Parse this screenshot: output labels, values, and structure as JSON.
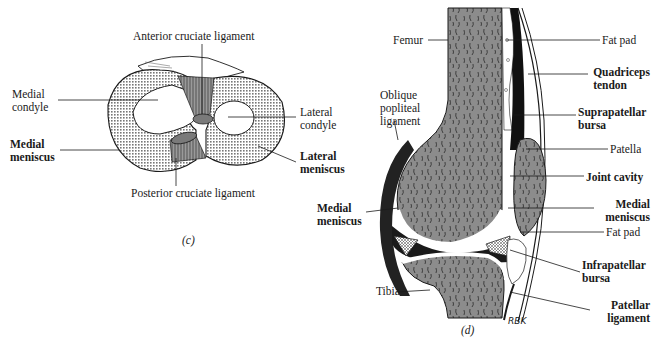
{
  "figure_c": {
    "caption": "(c)",
    "labels": {
      "anterior_cruciate": "Anterior cruciate ligament",
      "medial_condyle_1": "Medial",
      "medial_condyle_2": "condyle",
      "medial_meniscus_1": "Medial",
      "medial_meniscus_2": "meniscus",
      "lateral_condyle_1": "Lateral",
      "lateral_condyle_2": "condyle",
      "lateral_meniscus_1": "Lateral",
      "lateral_meniscus_2": "meniscus",
      "posterior_cruciate": "Posterior cruciate ligament"
    }
  },
  "figure_d": {
    "caption": "(d)",
    "signature": "RBK",
    "labels": {
      "femur": "Femur",
      "oblique_1": "Oblique",
      "oblique_2": "popliteal",
      "oblique_3": "ligament",
      "medial_meniscus_left_1": "Medial",
      "medial_meniscus_left_2": "meniscus",
      "tibia": "Tibia",
      "fat_pad_top": "Fat pad",
      "quadriceps_1": "Quadriceps",
      "quadriceps_2": "tendon",
      "suprapatellar_1": "Suprapatellar",
      "suprapatellar_2": "bursa",
      "patella": "Patella",
      "joint_cavity": "Joint cavity",
      "medial_meniscus_right_1": "Medial",
      "medial_meniscus_right_2": "meniscus",
      "fat_pad_bottom": "Fat pad",
      "infrapatellar_1": "Infrapatellar",
      "infrapatellar_2": "bursa",
      "patellar_lig_1": "Patellar",
      "patellar_lig_2": "ligament"
    }
  },
  "colors": {
    "bone": "#8c8c8c",
    "ink": "#1a1a1a",
    "ligament": "#6e6e6e"
  }
}
